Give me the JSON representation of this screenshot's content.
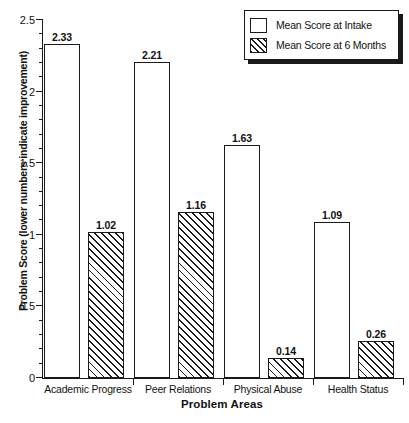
{
  "chart_data": {
    "type": "bar",
    "title": "",
    "xlabel": "Problem Areas",
    "ylabel": "Problem Score (lower numbers indicate improvement)",
    "categories": [
      "Academic Progress",
      "Peer Relations",
      "Physical Abuse",
      "Health Status"
    ],
    "series": [
      {
        "name": "Mean Score at Intake",
        "fill": "white",
        "values": [
          2.33,
          2.21,
          1.63,
          1.09
        ],
        "labels": [
          "2.33",
          "2.21",
          "1.63",
          "1.09"
        ]
      },
      {
        "name": "Mean Score at 6 Months",
        "fill": "diagonal-hatch",
        "values": [
          1.02,
          1.16,
          0.14,
          0.26
        ],
        "labels": [
          "1.02",
          "1.16",
          "0.14",
          "0.26"
        ]
      }
    ],
    "ylim": [
      0,
      2.5
    ],
    "ytick_labels": [
      "0",
      "0.5",
      "1",
      "1.5",
      "2",
      "2.5"
    ],
    "ytick_values": [
      0,
      0.5,
      1,
      1.5,
      2,
      2.5
    ],
    "yminor_step": 0.1,
    "grid": false,
    "legend_position": "top-right",
    "colors": {
      "axis": "#1a1a1a",
      "bar_edge": "#1a1a1a",
      "bar_fill_intake": "#ffffff",
      "bar_fill_six_months": "#ffffff",
      "hatch": "#1a1a1a",
      "background": "#ffffff"
    }
  },
  "legend": {
    "entries": [
      {
        "label": "Mean Score at Intake"
      },
      {
        "label": "Mean Score at 6 Months"
      }
    ]
  }
}
